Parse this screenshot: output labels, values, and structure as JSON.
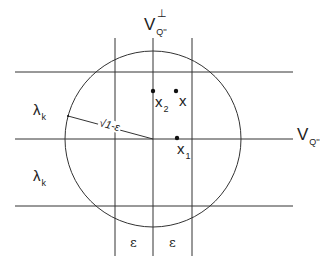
{
  "diagram": {
    "labels": {
      "v_perp": {
        "main": "V",
        "sub": "Q''",
        "sup": "⊥"
      },
      "v_q": {
        "main": "V",
        "sub": "Q''"
      },
      "lambda_top": {
        "main": "λ",
        "sub": "k"
      },
      "lambda_bottom": {
        "main": "λ",
        "sub": "k"
      },
      "radius": "√1-ε",
      "eps_left": "ε",
      "eps_right": "ε",
      "x2": {
        "main": "x",
        "sub": "2"
      },
      "x": {
        "main": "x"
      },
      "x1": {
        "main": "x",
        "sub": "1"
      }
    },
    "colors": {
      "line": "#333333",
      "text": "#222222",
      "background": "#ffffff"
    }
  }
}
